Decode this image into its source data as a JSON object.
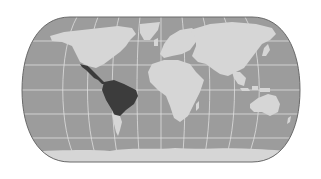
{
  "map": {
    "projection": "pseudo-cylindrical world (Eckert IV style)",
    "colors": {
      "background": "#ffffff",
      "ocean": "#9c9c9c",
      "land": "#d6d6d6",
      "highlight": "#3c3c3c",
      "graticule": "#e4e4e4",
      "frame": "#6a6a6a"
    },
    "highlighted_regions": [
      "Central America",
      "South America (northern & central)"
    ],
    "regions": [
      "North America",
      "Greenland",
      "Central America",
      "South America",
      "Europe",
      "Africa",
      "Asia",
      "Australia",
      "Antarctica"
    ]
  }
}
